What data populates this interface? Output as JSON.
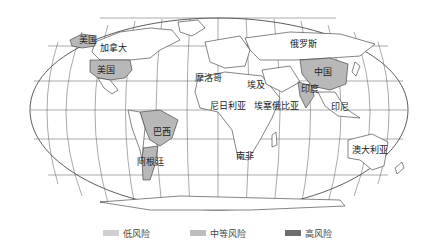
{
  "map": {
    "projection": "Robinson-like world map",
    "colors": {
      "low": "#cfcfcf",
      "medium": "#b8b8b8",
      "high": "#7a7a7a",
      "land_default": "#ffffff",
      "border": "#333333",
      "graticule": "#555555"
    },
    "country_labels": [
      {
        "name": "美国",
        "x": 88,
        "y": 40,
        "note": "Alaska"
      },
      {
        "name": "加拿大",
        "x": 113,
        "y": 48
      },
      {
        "name": "美国",
        "x": 106,
        "y": 70
      },
      {
        "name": "俄罗斯",
        "x": 303,
        "y": 44
      },
      {
        "name": "中国",
        "x": 323,
        "y": 72
      },
      {
        "name": "印度",
        "x": 310,
        "y": 89
      },
      {
        "name": "摩洛哥",
        "x": 208,
        "y": 78
      },
      {
        "name": "埃及",
        "x": 256,
        "y": 85
      },
      {
        "name": "尼日利亚",
        "x": 228,
        "y": 106
      },
      {
        "name": "埃塞俄比亚",
        "x": 276,
        "y": 106
      },
      {
        "name": "印尼",
        "x": 340,
        "y": 107
      },
      {
        "name": "巴西",
        "x": 162,
        "y": 132
      },
      {
        "name": "阿根廷",
        "x": 150,
        "y": 162
      },
      {
        "name": "南非",
        "x": 245,
        "y": 156
      },
      {
        "name": "澳大利亚",
        "x": 370,
        "y": 150
      }
    ]
  },
  "legend": {
    "items": [
      {
        "label": "低风险",
        "color": "#cfcfcf"
      },
      {
        "label": "中等风险",
        "color": "#bdbdbd"
      },
      {
        "label": "高风险",
        "color": "#6e6e6e"
      }
    ]
  }
}
